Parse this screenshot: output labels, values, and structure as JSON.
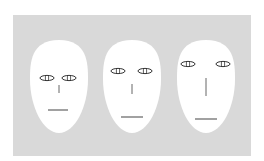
{
  "figure": {
    "background_color": "#d9d9d9",
    "face_color": "#ffffff",
    "stroke_color": "#333333",
    "faces": [
      {
        "id": "face-1",
        "label": "compact features",
        "cx": 59,
        "top": 40,
        "bottom": 133,
        "rx": 29,
        "eyes": {
          "y": 78,
          "left_cx": 47,
          "right_cx": 69,
          "rx": 7,
          "ry": 2.6
        },
        "nose": {
          "x": 59,
          "y1": 85,
          "y2": 93
        },
        "mouth": {
          "y": 110,
          "x1": 48,
          "x2": 68
        }
      },
      {
        "id": "face-2",
        "label": "medium features",
        "cx": 132,
        "top": 40,
        "bottom": 133,
        "rx": 29,
        "eyes": {
          "y": 71,
          "left_cx": 118,
          "right_cx": 145,
          "rx": 7,
          "ry": 2.6
        },
        "nose": {
          "x": 132,
          "y1": 84,
          "y2": 94
        },
        "mouth": {
          "y": 117,
          "x1": 121,
          "x2": 143
        }
      },
      {
        "id": "face-3",
        "label": "widely spaced features",
        "cx": 206,
        "top": 40,
        "bottom": 133,
        "rx": 29,
        "eyes": {
          "y": 64,
          "left_cx": 188,
          "right_cx": 223,
          "rx": 7,
          "ry": 2.6
        },
        "nose": {
          "x": 206,
          "y1": 78,
          "y2": 96
        },
        "mouth": {
          "y": 119,
          "x1": 195,
          "x2": 217
        }
      }
    ]
  }
}
